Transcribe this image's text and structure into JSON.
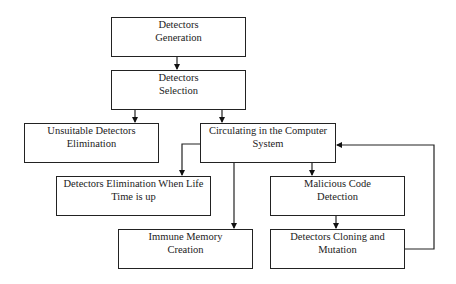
{
  "diagram": {
    "nodes": [
      {
        "id": "generation",
        "lines": [
          "Detectors",
          "Generation"
        ]
      },
      {
        "id": "selection",
        "lines": [
          "Detectors",
          "Selection"
        ]
      },
      {
        "id": "unsuitable",
        "lines": [
          "Unsuitable Detectors",
          "Elimination"
        ]
      },
      {
        "id": "circulating",
        "lines": [
          "Circulating in the Computer",
          "System"
        ]
      },
      {
        "id": "lifetime",
        "lines": [
          "Detectors Elimination When Life",
          "Time is up"
        ]
      },
      {
        "id": "malicious",
        "lines": [
          "Malicious Code",
          "Detection"
        ]
      },
      {
        "id": "memory",
        "lines": [
          "Immune Memory",
          "Creation"
        ]
      },
      {
        "id": "cloning",
        "lines": [
          "Detectors Cloning and",
          "Mutation"
        ]
      }
    ],
    "edges": [
      {
        "from": "generation",
        "to": "selection"
      },
      {
        "from": "selection",
        "to": "unsuitable"
      },
      {
        "from": "selection",
        "to": "circulating"
      },
      {
        "from": "circulating",
        "to": "lifetime"
      },
      {
        "from": "circulating",
        "to": "memory"
      },
      {
        "from": "circulating",
        "to": "malicious"
      },
      {
        "from": "malicious",
        "to": "cloning"
      },
      {
        "from": "cloning",
        "to": "circulating"
      }
    ]
  }
}
